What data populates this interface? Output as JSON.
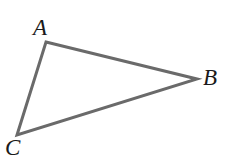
{
  "figure": {
    "kind": "geometry-diagram",
    "shape_name": "triangle",
    "width": 232,
    "height": 159,
    "background_color": "#ffffff",
    "stroke_color": "#6a6a6a",
    "stroke_width": 3,
    "label_color": "#1a1a1a",
    "label_font_size": 23,
    "vertices": [
      {
        "label": "A",
        "x": 46,
        "y": 42,
        "label_x": 42,
        "label_y": 28
      },
      {
        "label": "B",
        "x": 197,
        "y": 79,
        "label_x": 211,
        "label_y": 78
      },
      {
        "label": "C",
        "x": 17,
        "y": 135,
        "label_x": 14,
        "label_y": 148
      }
    ],
    "edges": [
      {
        "name": "AB",
        "from": "A",
        "to": "B"
      },
      {
        "name": "BC",
        "from": "B",
        "to": "C"
      },
      {
        "name": "CA",
        "from": "C",
        "to": "A"
      }
    ],
    "path": "M 46 42 L 197 79 L 17 135 Z"
  },
  "labels": {
    "a": "A",
    "b": "B",
    "c": "C"
  }
}
